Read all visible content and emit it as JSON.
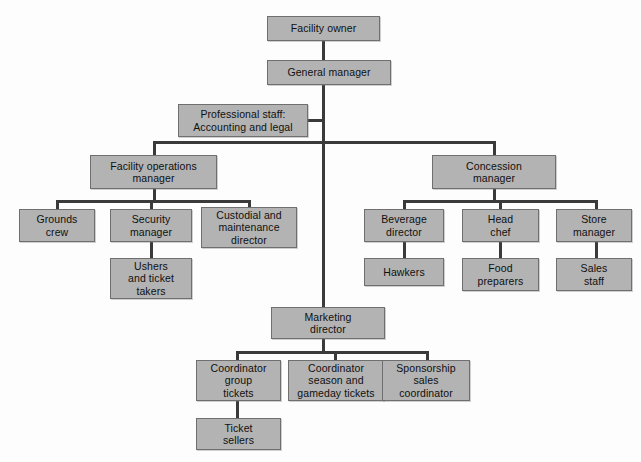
{
  "chart_data": {
    "type": "diagram",
    "diagram_kind": "organizational-chart",
    "title": "",
    "colors": {
      "node_fill": "#b3b3b3",
      "node_border": "#6f6f6f",
      "connector": "#3a3a3a",
      "background": "#fdfdfd",
      "text": "#101010"
    },
    "nodes": [
      {
        "id": "facility-owner",
        "label": "Facility owner",
        "level": 0,
        "x": 267,
        "y": 16,
        "w": 113,
        "h": 25
      },
      {
        "id": "general-manager",
        "label": "General manager",
        "level": 1,
        "x": 267,
        "y": 60,
        "w": 124,
        "h": 25
      },
      {
        "id": "professional-staff",
        "label": "Professional staff:\nAccounting and legal",
        "level": 2,
        "x": 178,
        "y": 104,
        "w": 130,
        "h": 33
      },
      {
        "id": "facility-ops-manager",
        "label": "Facility operations\nmanager",
        "level": 2,
        "x": 90,
        "y": 155,
        "w": 127,
        "h": 34
      },
      {
        "id": "concession-manager",
        "label": "Concession\nmanager",
        "level": 2,
        "x": 432,
        "y": 155,
        "w": 124,
        "h": 34
      },
      {
        "id": "grounds-crew",
        "label": "Grounds\ncrew",
        "level": 3,
        "x": 19,
        "y": 209,
        "w": 76,
        "h": 33
      },
      {
        "id": "security-manager",
        "label": "Security\nmanager",
        "level": 3,
        "x": 110,
        "y": 209,
        "w": 82,
        "h": 33
      },
      {
        "id": "custodial-maintenance",
        "label": "Custodial and\nmaintenance\ndirector",
        "level": 3,
        "x": 201,
        "y": 207,
        "w": 96,
        "h": 41
      },
      {
        "id": "ushers-ticket-takers",
        "label": "Ushers\nand ticket\ntakers",
        "level": 4,
        "x": 110,
        "y": 258,
        "w": 82,
        "h": 41
      },
      {
        "id": "beverage-director",
        "label": "Beverage\ndirector",
        "level": 3,
        "x": 364,
        "y": 209,
        "w": 80,
        "h": 33
      },
      {
        "id": "head-chef",
        "label": "Head\nchef",
        "level": 3,
        "x": 462,
        "y": 209,
        "w": 77,
        "h": 33
      },
      {
        "id": "store-manager",
        "label": "Store\nmanager",
        "level": 3,
        "x": 556,
        "y": 209,
        "w": 76,
        "h": 33
      },
      {
        "id": "hawkers",
        "label": "Hawkers",
        "level": 4,
        "x": 364,
        "y": 258,
        "w": 80,
        "h": 28
      },
      {
        "id": "food-preparers",
        "label": "Food\npreparers",
        "level": 4,
        "x": 462,
        "y": 258,
        "w": 77,
        "h": 33
      },
      {
        "id": "sales-staff",
        "label": "Sales\nstaff",
        "level": 4,
        "x": 556,
        "y": 258,
        "w": 76,
        "h": 33
      },
      {
        "id": "marketing-director",
        "label": "Marketing\ndirector",
        "level": 3,
        "x": 271,
        "y": 307,
        "w": 114,
        "h": 32
      },
      {
        "id": "coordinator-group",
        "label": "Coordinator\ngroup\ntickets",
        "level": 4,
        "x": 196,
        "y": 360,
        "w": 85,
        "h": 41
      },
      {
        "id": "coordinator-season",
        "label": "Coordinator\nseason and\ngameday tickets",
        "level": 4,
        "x": 288,
        "y": 360,
        "w": 96,
        "h": 41
      },
      {
        "id": "sponsorship-sales",
        "label": "Sponsorship\nsales\ncoordinator",
        "level": 4,
        "x": 382,
        "y": 360,
        "w": 88,
        "h": 41
      },
      {
        "id": "ticket-sellers",
        "label": "Ticket\nsellers",
        "level": 5,
        "x": 196,
        "y": 418,
        "w": 85,
        "h": 32
      }
    ],
    "connectors": [
      {
        "from": "facility-owner",
        "to": "general-manager",
        "orient": "v",
        "x": 322,
        "y": 41,
        "len": 19
      },
      {
        "from": "general-manager",
        "to": "spine",
        "orient": "v",
        "x": 322,
        "y": 85,
        "len": 222
      },
      {
        "from": "professional-staff",
        "to": "spine",
        "orient": "h",
        "x": 308,
        "y": 119,
        "len": 16
      },
      {
        "from": "spine",
        "to": "manager-row",
        "orient": "h",
        "x": 153,
        "y": 141,
        "len": 341
      },
      {
        "from": "manager-row",
        "to": "facility-ops-manager",
        "orient": "v",
        "x": 153,
        "y": 141,
        "len": 15
      },
      {
        "from": "manager-row",
        "to": "concession-manager",
        "orient": "v",
        "x": 493,
        "y": 141,
        "len": 15
      },
      {
        "from": "facility-ops-manager",
        "to": "ops-bar",
        "orient": "v",
        "x": 153,
        "y": 189,
        "len": 12
      },
      {
        "from": "ops-bar",
        "to": "ops-children",
        "orient": "h",
        "x": 56,
        "y": 200,
        "len": 194
      },
      {
        "from": "ops-bar",
        "to": "grounds-crew",
        "orient": "v",
        "x": 56,
        "y": 200,
        "len": 10
      },
      {
        "from": "ops-bar",
        "to": "security-manager",
        "orient": "v",
        "x": 150,
        "y": 200,
        "len": 10
      },
      {
        "from": "ops-bar",
        "to": "custodial-maintenance",
        "orient": "v",
        "x": 248,
        "y": 200,
        "len": 10
      },
      {
        "from": "security-manager",
        "to": "ushers-ticket-takers",
        "orient": "v",
        "x": 150,
        "y": 242,
        "len": 17
      },
      {
        "from": "concession-manager",
        "to": "conc-bar",
        "orient": "v",
        "x": 493,
        "y": 189,
        "len": 12
      },
      {
        "from": "conc-bar",
        "to": "conc-children",
        "orient": "h",
        "x": 403,
        "y": 200,
        "len": 194
      },
      {
        "from": "conc-bar",
        "to": "beverage-director",
        "orient": "v",
        "x": 403,
        "y": 200,
        "len": 10
      },
      {
        "from": "conc-bar",
        "to": "head-chef",
        "orient": "v",
        "x": 499,
        "y": 200,
        "len": 10
      },
      {
        "from": "conc-bar",
        "to": "store-manager",
        "orient": "v",
        "x": 595,
        "y": 200,
        "len": 10
      },
      {
        "from": "beverage-director",
        "to": "hawkers",
        "orient": "v",
        "x": 403,
        "y": 242,
        "len": 17
      },
      {
        "from": "head-chef",
        "to": "food-preparers",
        "orient": "v",
        "x": 499,
        "y": 242,
        "len": 17
      },
      {
        "from": "store-manager",
        "to": "sales-staff",
        "orient": "v",
        "x": 595,
        "y": 242,
        "len": 17
      },
      {
        "from": "marketing-director",
        "to": "mkt-bar",
        "orient": "v",
        "x": 322,
        "y": 339,
        "len": 13
      },
      {
        "from": "mkt-bar",
        "to": "mkt-children",
        "orient": "h",
        "x": 236,
        "y": 351,
        "len": 192
      },
      {
        "from": "mkt-bar",
        "to": "coordinator-group",
        "orient": "v",
        "x": 236,
        "y": 351,
        "len": 10
      },
      {
        "from": "mkt-bar",
        "to": "coordinator-season",
        "orient": "v",
        "x": 334,
        "y": 351,
        "len": 10
      },
      {
        "from": "mkt-bar",
        "to": "sponsorship-sales",
        "orient": "v",
        "x": 426,
        "y": 351,
        "len": 10
      },
      {
        "from": "coordinator-group",
        "to": "ticket-sellers",
        "orient": "v",
        "x": 236,
        "y": 401,
        "len": 18
      }
    ]
  }
}
